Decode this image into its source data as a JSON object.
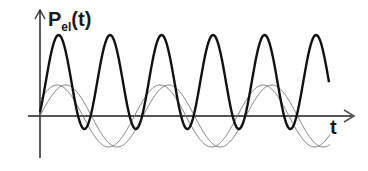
{
  "chart_data": {
    "type": "line",
    "title": "",
    "ylabel": "P_el(t)",
    "ylabel_main": "P",
    "ylabel_sub": "el",
    "ylabel_tail": "(t)",
    "xlabel": "t",
    "grid": false,
    "legend": null,
    "series": [
      {
        "name": "power P_el(t)",
        "style": "thick",
        "color": "#111111",
        "amplitude": 46,
        "offset": 46,
        "period": 51.5,
        "phase_deg": -90
      },
      {
        "name": "voltage u(t)",
        "style": "thin",
        "color": "#666666",
        "amplitude": 31,
        "period": 103,
        "phase_deg": 0
      },
      {
        "name": "current i(t)",
        "style": "thin",
        "color": "#666666",
        "amplitude": 31,
        "period": 103,
        "phase_deg": 30
      }
    ]
  },
  "axes": {
    "y_label": "P",
    "y_sub": "el",
    "y_tail": "(t)",
    "x_label": "t"
  }
}
